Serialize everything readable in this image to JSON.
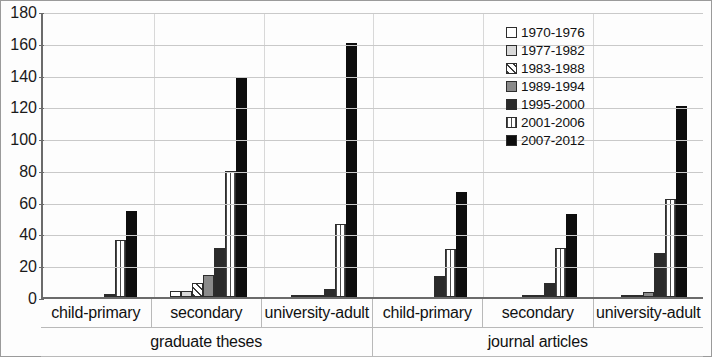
{
  "chart_data": {
    "type": "bar",
    "title": "",
    "xlabel": "",
    "ylabel": "",
    "ylim": [
      0,
      180
    ],
    "y_ticks": [
      0,
      20,
      40,
      60,
      80,
      100,
      120,
      140,
      160,
      180
    ],
    "grid": true,
    "legend_position": "inside-top-right",
    "categories": [
      "child-primary",
      "secondary",
      "university-adult",
      "child-primary",
      "secondary",
      "university-adult"
    ],
    "super_categories": [
      {
        "label": "graduate theses",
        "span": 3
      },
      {
        "label": "journal articles",
        "span": 3
      }
    ],
    "series": [
      {
        "name": "1970-1976",
        "pattern": "empty",
        "values": [
          0,
          4,
          0,
          0,
          0,
          0
        ]
      },
      {
        "name": "1977-1982",
        "pattern": "light-gray",
        "values": [
          0,
          4,
          1,
          0,
          0,
          1
        ]
      },
      {
        "name": "1983-1988",
        "pattern": "diagonal-hatch",
        "values": [
          0,
          9,
          1,
          0,
          1,
          1
        ]
      },
      {
        "name": "1989-1994",
        "pattern": "medium-gray",
        "values": [
          0,
          14,
          1,
          0,
          1,
          3
        ]
      },
      {
        "name": "1995-2000",
        "pattern": "dark-solid",
        "values": [
          2,
          31,
          5,
          13,
          9,
          28
        ]
      },
      {
        "name": "2001-2006",
        "pattern": "vertical-stripes",
        "values": [
          36,
          79,
          46,
          30,
          31,
          62
        ]
      },
      {
        "name": "2007-2012",
        "pattern": "black-solid",
        "values": [
          54,
          138,
          160,
          66,
          52,
          120
        ]
      }
    ]
  },
  "legend": {
    "items": [
      "1970-1976",
      "1977-1982",
      "1983-1988",
      "1989-1994",
      "1995-2000",
      "2001-2006",
      "2007-2012"
    ]
  },
  "colors": {
    "axis": "#6b6b6b",
    "grid": "#c9c9c9",
    "series_dark": "#2b2b2b",
    "series_black": "#0d0d0d",
    "series_light": "#d9d9d9",
    "series_medium": "#8a8a8a",
    "text": "#111111",
    "frame": "#9a9a9a"
  }
}
